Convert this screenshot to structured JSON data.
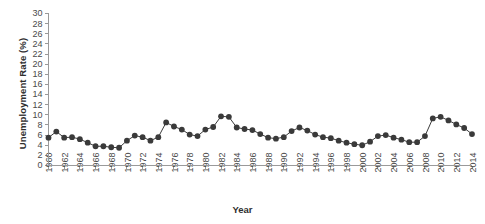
{
  "chart_data": {
    "type": "line",
    "title": "",
    "xlabel": "Year",
    "ylabel": "Unemployment Rate (%)",
    "xlim": [
      1960,
      2014
    ],
    "ylim": [
      0,
      30
    ],
    "ytick_step": 2,
    "xtick_step": 2,
    "grid": false,
    "legend": "none",
    "marker": "filled-circle",
    "series_color": "#3a3a3a",
    "yticks": [
      0,
      2,
      4,
      6,
      8,
      10,
      12,
      14,
      16,
      18,
      20,
      22,
      24,
      26,
      28,
      30
    ],
    "xticks": [
      1960,
      1962,
      1964,
      1966,
      1968,
      1970,
      1972,
      1974,
      1976,
      1978,
      1980,
      1982,
      1984,
      1986,
      1988,
      1990,
      1992,
      1994,
      1996,
      1998,
      2000,
      2002,
      2004,
      2006,
      2008,
      2010,
      2012,
      2014
    ],
    "x": [
      1960,
      1961,
      1962,
      1963,
      1964,
      1965,
      1966,
      1967,
      1968,
      1969,
      1970,
      1971,
      1972,
      1973,
      1974,
      1975,
      1976,
      1977,
      1978,
      1979,
      1980,
      1981,
      1982,
      1983,
      1984,
      1985,
      1986,
      1987,
      1988,
      1989,
      1990,
      1991,
      1992,
      1993,
      1994,
      1995,
      1996,
      1997,
      1998,
      1999,
      2000,
      2001,
      2002,
      2003,
      2004,
      2005,
      2006,
      2007,
      2008,
      2009,
      2010,
      2011,
      2012,
      2013,
      2014
    ],
    "values": [
      5.5,
      6.7,
      5.5,
      5.6,
      5.2,
      4.5,
      3.8,
      3.8,
      3.6,
      3.5,
      4.9,
      5.9,
      5.6,
      4.9,
      5.6,
      8.5,
      7.7,
      7.1,
      6.1,
      5.8,
      7.1,
      7.6,
      9.7,
      9.6,
      7.5,
      7.2,
      7.0,
      6.2,
      5.5,
      5.3,
      5.6,
      6.8,
      7.5,
      6.9,
      6.1,
      5.6,
      5.4,
      4.9,
      4.5,
      4.2,
      4.0,
      4.7,
      5.8,
      6.0,
      5.5,
      5.1,
      4.6,
      4.6,
      5.8,
      9.3,
      9.6,
      8.9,
      8.1,
      7.4,
      6.2
    ],
    "series_name": "Unemployment Rate"
  }
}
